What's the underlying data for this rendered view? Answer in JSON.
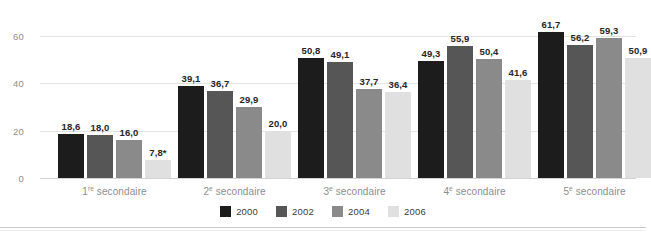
{
  "chart_data": {
    "type": "bar",
    "title": "",
    "subtitle": "",
    "xlabel": "",
    "ylabel": "",
    "categories": [
      "1re secondaire",
      "2e secondaire",
      "3e secondaire",
      "4e secondaire",
      "5e secondaire"
    ],
    "category_parts": [
      {
        "num": "1",
        "sup": "re",
        "rest": " secondaire"
      },
      {
        "num": "2",
        "sup": "e",
        "rest": " secondaire"
      },
      {
        "num": "3",
        "sup": "e",
        "rest": " secondaire"
      },
      {
        "num": "4",
        "sup": "e",
        "rest": " secondaire"
      },
      {
        "num": "5",
        "sup": "e",
        "rest": " secondaire"
      }
    ],
    "series": [
      {
        "name": "2000",
        "color": "#1c1c1c",
        "values": [
          18.6,
          39.1,
          50.8,
          49.3,
          61.7
        ],
        "labels": [
          "18,6",
          "39,1",
          "50,8",
          "49,3",
          "61,7"
        ]
      },
      {
        "name": "2002",
        "color": "#565656",
        "values": [
          18.0,
          36.7,
          49.1,
          55.9,
          56.2
        ],
        "labels": [
          "18,0",
          "36,7",
          "49,1",
          "55,9",
          "56,2"
        ]
      },
      {
        "name": "2004",
        "color": "#8a8a8a",
        "values": [
          16.0,
          29.9,
          37.7,
          50.4,
          59.3
        ],
        "labels": [
          "16,0",
          "29,9",
          "37,7",
          "50,4",
          "59,3"
        ]
      },
      {
        "name": "2006",
        "color": "#e0e0e0",
        "values": [
          7.8,
          20.0,
          36.4,
          41.6,
          50.9
        ],
        "labels": [
          "7,8*",
          "20,0",
          "36,4",
          "41,6",
          "50,9"
        ]
      }
    ],
    "yticks": [
      0,
      20,
      40,
      60
    ],
    "ytick_labels": [
      "0",
      "20",
      "40",
      "60"
    ],
    "ylim": [
      0,
      66
    ],
    "grid": true,
    "legend_position": "bottom",
    "note": "*"
  },
  "legend": {
    "items": [
      {
        "label": "2000",
        "color": "#1c1c1c"
      },
      {
        "label": "2002",
        "color": "#565656"
      },
      {
        "label": "2004",
        "color": "#8a8a8a"
      },
      {
        "label": "2006",
        "color": "#e0e0e0"
      }
    ]
  }
}
